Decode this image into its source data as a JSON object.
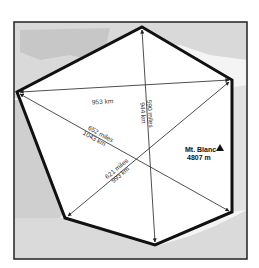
{
  "map": {
    "colors": {
      "background": "#ffffff",
      "land": "#e6e6e6",
      "land_dark": "#c8c8c8",
      "sea": "#f8f8f8",
      "frame": "#222222",
      "hexagon": "#111111",
      "arrows": "#222222"
    },
    "frame": {
      "x": 14,
      "y": 22,
      "width": 233,
      "height": 237
    },
    "hexagon_vertices": [
      {
        "name": "top",
        "x": 142,
        "y": 27
      },
      {
        "name": "upper-right",
        "x": 232,
        "y": 80
      },
      {
        "name": "lower-right",
        "x": 232,
        "y": 212
      },
      {
        "name": "bottom",
        "x": 155,
        "y": 245
      },
      {
        "name": "lower-left",
        "x": 65,
        "y": 218
      },
      {
        "name": "left",
        "x": 17,
        "y": 92
      }
    ],
    "distances": [
      {
        "id": "west-east",
        "label": "953 km",
        "from": "left",
        "to": "upper-right"
      },
      {
        "id": "north-south",
        "label_miles": "590 miles",
        "label_km": "944 km",
        "from": "top",
        "to": "bottom"
      },
      {
        "id": "west-southeast",
        "label_miles": "652 miles",
        "label_km": "1043 km",
        "from": "left",
        "to": "lower-right"
      },
      {
        "id": "northeast-southwest",
        "label_miles": "621 miles",
        "label_km": "993 km",
        "from": "upper-right",
        "to": "lower-left"
      }
    ],
    "landmark": {
      "name": "Mt. Blanc",
      "elevation": "4807 m",
      "icon": "mountain-triangle-icon"
    }
  }
}
